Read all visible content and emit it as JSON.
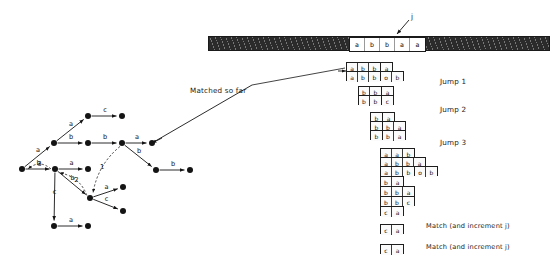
{
  "figure": {
    "background": "#ffffff",
    "ink": "#141414"
  },
  "text_strip": {
    "pointer_label": "j",
    "window_cells": [
      "a",
      "b",
      "b",
      "a",
      "a"
    ],
    "hatch_color": "#2b2b2b"
  },
  "annotations": {
    "matched_so_far": "Matched so far",
    "jump1": "Jump 1",
    "jump2": "Jump 2",
    "jump3": "Jump 3",
    "match1": "Match (and increment j)",
    "match2": "Match (and increment j)"
  },
  "pattern_rows": [
    {
      "id": "r1",
      "left": 346,
      "top": 62,
      "segments": [
        [
          "a",
          "b",
          "b"
        ],
        [
          "a"
        ]
      ]
    },
    {
      "id": "r2",
      "left": 346,
      "top": 71,
      "segments": [
        [
          "a",
          "b",
          "b"
        ],
        [
          "o",
          "b"
        ]
      ]
    },
    {
      "id": "r3",
      "left": 358,
      "top": 86,
      "segments": [
        [
          "b",
          "b"
        ],
        [
          "a"
        ]
      ]
    },
    {
      "id": "r4",
      "left": 358,
      "top": 95,
      "segments": [
        [
          "b",
          "b"
        ],
        [
          "c"
        ]
      ]
    },
    {
      "id": "r5",
      "left": 370,
      "top": 112,
      "segments": [
        [
          "b"
        ],
        [
          "a"
        ]
      ]
    },
    {
      "id": "r6",
      "left": 370,
      "top": 121,
      "segments": [
        [
          "b"
        ],
        [
          "b",
          "a"
        ]
      ]
    },
    {
      "id": "r7",
      "left": 370,
      "top": 130,
      "segments": [
        [
          "b"
        ],
        [
          "b",
          "a"
        ]
      ]
    },
    {
      "id": "r8",
      "left": 380,
      "top": 148,
      "segments": [
        [
          "a",
          "a",
          "b"
        ]
      ]
    },
    {
      "id": "r9",
      "left": 380,
      "top": 157,
      "segments": [
        [
          "a",
          "b",
          "b",
          "a"
        ]
      ]
    },
    {
      "id": "r10",
      "left": 380,
      "top": 166,
      "segments": [
        [
          "a",
          "b",
          "b"
        ],
        [
          "o",
          "b"
        ]
      ]
    },
    {
      "id": "r11",
      "left": 380,
      "top": 176,
      "segments": [
        [
          "b",
          "a"
        ]
      ]
    },
    {
      "id": "r12",
      "left": 380,
      "top": 186,
      "segments": [
        [
          "b",
          "b",
          "a"
        ]
      ]
    },
    {
      "id": "r13",
      "left": 380,
      "top": 196,
      "segments": [
        [
          "b",
          "b",
          "c"
        ]
      ]
    },
    {
      "id": "r14",
      "left": 380,
      "top": 206,
      "segments": [
        [
          "c",
          "a"
        ]
      ]
    },
    {
      "id": "r15",
      "left": 380,
      "top": 224,
      "segments": [
        [
          "c",
          "a"
        ]
      ]
    },
    {
      "id": "r16",
      "left": 380,
      "top": 244,
      "segments": [
        [
          "c",
          "a"
        ]
      ]
    }
  ],
  "trie": {
    "nodes": [
      {
        "id": "n_root",
        "x": 22,
        "y": 169
      },
      {
        "id": "n_a1",
        "x": 55,
        "y": 169
      },
      {
        "id": "n_a2",
        "x": 88,
        "y": 169
      },
      {
        "id": "n_up1",
        "x": 54,
        "y": 143
      },
      {
        "id": "n_up2",
        "x": 88,
        "y": 143
      },
      {
        "id": "n_up3",
        "x": 122,
        "y": 143
      },
      {
        "id": "n_up4",
        "x": 152,
        "y": 143
      },
      {
        "id": "n_top1",
        "x": 88,
        "y": 116
      },
      {
        "id": "n_top2",
        "x": 122,
        "y": 116
      },
      {
        "id": "n_rb1",
        "x": 156,
        "y": 170
      },
      {
        "id": "n_rb2",
        "x": 190,
        "y": 170
      },
      {
        "id": "n_mid",
        "x": 90,
        "y": 198
      },
      {
        "id": "n_ma",
        "x": 123,
        "y": 187
      },
      {
        "id": "n_mc",
        "x": 123,
        "y": 211
      },
      {
        "id": "n_low1",
        "x": 54,
        "y": 226
      },
      {
        "id": "n_low2",
        "x": 88,
        "y": 226
      }
    ],
    "edges": [
      {
        "from": "n_root",
        "to": "n_a1",
        "label": "b",
        "style": "solid"
      },
      {
        "from": "n_a1",
        "to": "n_a2",
        "label": "a",
        "style": "solid"
      },
      {
        "from": "n_root",
        "to": "n_up1",
        "label": "a",
        "style": "solid"
      },
      {
        "from": "n_up1",
        "to": "n_up2",
        "label": "b",
        "style": "solid"
      },
      {
        "from": "n_up2",
        "to": "n_up3",
        "label": "b",
        "style": "solid"
      },
      {
        "from": "n_up3",
        "to": "n_up4",
        "label": "a",
        "style": "solid"
      },
      {
        "from": "n_up1",
        "to": "n_top1",
        "label": "a",
        "style": "solid"
      },
      {
        "from": "n_top1",
        "to": "n_top2",
        "label": "c",
        "style": "solid"
      },
      {
        "from": "n_up3",
        "to": "n_rb1",
        "label": "b",
        "style": "solid"
      },
      {
        "from": "n_rb1",
        "to": "n_rb2",
        "label": "b",
        "style": "solid"
      },
      {
        "from": "n_a1",
        "to": "n_mid",
        "label": "b",
        "style": "solid"
      },
      {
        "from": "n_mid",
        "to": "n_ma",
        "label": "a",
        "style": "solid"
      },
      {
        "from": "n_mid",
        "to": "n_mc",
        "label": "c",
        "style": "solid"
      },
      {
        "from": "n_a1",
        "to": "n_low1",
        "label": "c",
        "style": "solid"
      },
      {
        "from": "n_low1",
        "to": "n_low2",
        "label": "a",
        "style": "solid"
      }
    ],
    "fail_links": [
      {
        "from": "n_up3",
        "to": "n_mid",
        "label": "1"
      },
      {
        "from": "n_mid",
        "to": "n_a1",
        "label": "2"
      },
      {
        "from": "n_a1",
        "to": "n_root",
        "label": "3"
      }
    ]
  }
}
